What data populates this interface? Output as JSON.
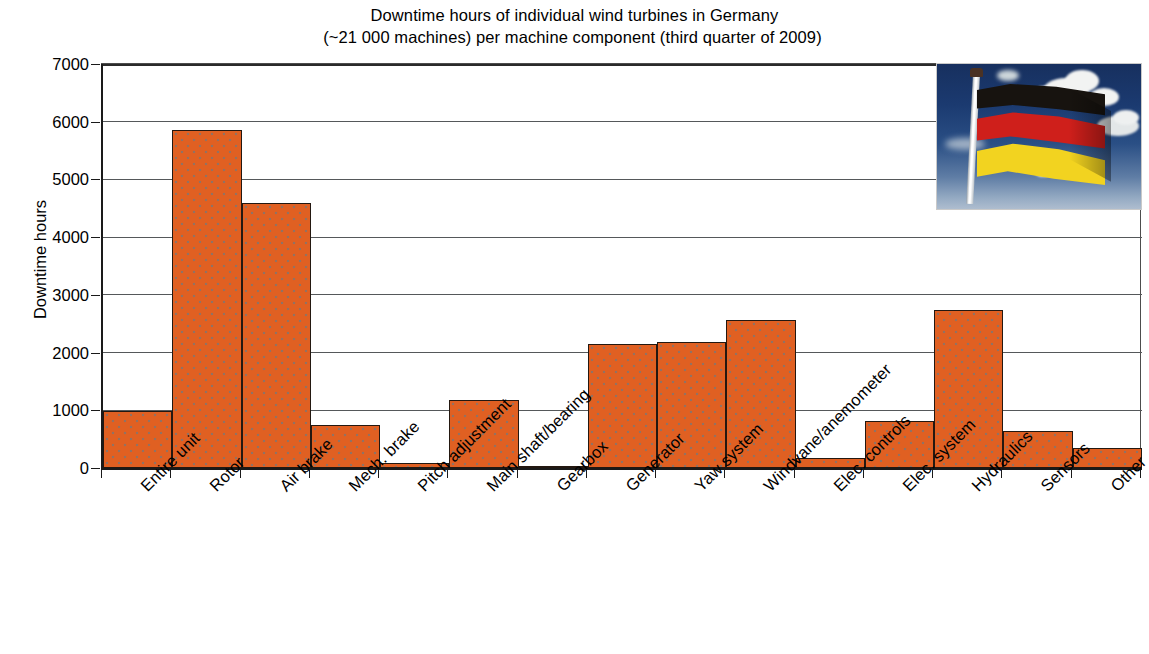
{
  "chart_data": {
    "type": "bar",
    "title": "Downtime hours of individual wind turbines in Germany (~21 000 machines) per machine component (third quarter of 2009)",
    "title_line1": "Downtime hours of individual wind turbines in Germany",
    "title_line2": "(~21 000 machines) per machine component (third quarter of 2009)",
    "xlabel": "",
    "ylabel": "Downtime hours",
    "ylim": [
      0,
      7000
    ],
    "ytick_values": [
      0,
      1000,
      2000,
      3000,
      4000,
      5000,
      6000,
      7000
    ],
    "ytick_labels": [
      "0",
      "1000",
      "2000",
      "3000",
      "4000",
      "5000",
      "6000",
      "7000"
    ],
    "grid": true,
    "legend": "none",
    "bar_color": "#e06022",
    "bar_edge_color": "#231811",
    "categories": [
      "Entire unit",
      "Rotor",
      "Air brake",
      "Mech. brake",
      "Pitch adjustment",
      "Main shaft/bearing",
      "Gearbox",
      "Generator",
      "Yaw system",
      "Windvane/anemometer",
      "Elec. controls",
      "Elec. system",
      "Hydraulics",
      "Sensors",
      "Other"
    ],
    "values": [
      980,
      5850,
      4600,
      750,
      80,
      1180,
      10,
      2150,
      2190,
      2560,
      180,
      820,
      2730,
      640,
      350
    ]
  },
  "inset_photo": {
    "name": "german-flag-photo",
    "description": "Photograph of the German national flag (black, red, gold) on a white flagpole against a blue sky with white clouds"
  }
}
